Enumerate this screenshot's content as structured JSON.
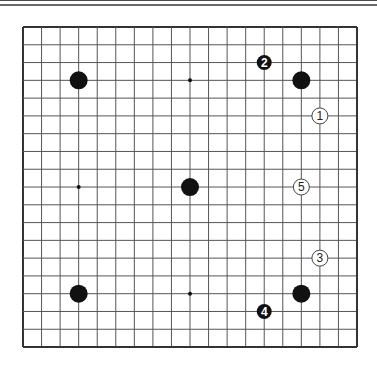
{
  "board": {
    "size": 19,
    "origin_x": 23,
    "origin_y": 27,
    "spacing_x": 18.556,
    "spacing_y": 17.78,
    "line_color": "#555555",
    "border_color": "#333333",
    "background": "#ffffff"
  },
  "star_points": [
    {
      "col": 3,
      "row": 3
    },
    {
      "col": 9,
      "row": 3
    },
    {
      "col": 15,
      "row": 3
    },
    {
      "col": 3,
      "row": 9
    },
    {
      "col": 9,
      "row": 9
    },
    {
      "col": 15,
      "row": 9
    },
    {
      "col": 3,
      "row": 15
    },
    {
      "col": 9,
      "row": 15
    },
    {
      "col": 15,
      "row": 15
    }
  ],
  "stones": [
    {
      "color": "black",
      "col": 3,
      "row": 3,
      "label": ""
    },
    {
      "color": "black",
      "col": 15,
      "row": 3,
      "label": ""
    },
    {
      "color": "black",
      "col": 9,
      "row": 9,
      "label": ""
    },
    {
      "color": "black",
      "col": 3,
      "row": 15,
      "label": ""
    },
    {
      "color": "black",
      "col": 15,
      "row": 15,
      "label": ""
    },
    {
      "color": "white",
      "col": 16,
      "row": 5,
      "label": "1"
    },
    {
      "color": "black",
      "col": 13,
      "row": 2,
      "label": "2"
    },
    {
      "color": "white",
      "col": 16,
      "row": 13,
      "label": "3"
    },
    {
      "color": "black",
      "col": 13,
      "row": 16,
      "label": "4"
    },
    {
      "color": "white",
      "col": 15,
      "row": 9,
      "label": "5"
    }
  ],
  "colors": {
    "black_stone": "#111111",
    "white_stone": "#ffffff",
    "white_stone_border": "#444444",
    "label_on_black": "#ffffff",
    "label_on_white": "#222222"
  }
}
